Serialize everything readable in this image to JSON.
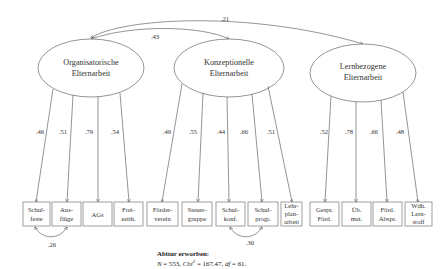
{
  "diagram": {
    "type": "structural-equation-model",
    "latent_factors": [
      {
        "id": "org",
        "label_line1": "Organisatorische",
        "label_line2": "Elternarbeit"
      },
      {
        "id": "konz",
        "label_line1": "Konzeptionelle",
        "label_line2": "Elternarbeit"
      },
      {
        "id": "lern",
        "label_line1": "Lernbezogene",
        "label_line2": "Elternarbeit"
      }
    ],
    "factor_correlations": [
      {
        "from": "org",
        "to": "konz",
        "value": ".43"
      },
      {
        "from": "org",
        "to": "lern",
        "value": ".21"
      }
    ],
    "indicators": [
      {
        "factor": "org",
        "line1": "Schul-",
        "line2": "feste",
        "line3": "",
        "loading": ".46"
      },
      {
        "factor": "org",
        "line1": "Aus-",
        "line2": "flüge",
        "line3": "",
        "loading": ".51"
      },
      {
        "factor": "org",
        "line1": "AGs",
        "line2": "",
        "line3": "",
        "loading": ".79"
      },
      {
        "factor": "org",
        "line1": "Frei-",
        "line2": "zeith.",
        "line3": "",
        "loading": ".54"
      },
      {
        "factor": "konz",
        "line1": "Förder-",
        "line2": "verein",
        "line3": "",
        "loading": ".49"
      },
      {
        "factor": "konz",
        "line1": "Steuer-",
        "line2": "gruppe",
        "line3": "",
        "loading": ".55"
      },
      {
        "factor": "konz",
        "line1": "Schul-",
        "line2": "konf.",
        "line3": "",
        "loading": ".44"
      },
      {
        "factor": "konz",
        "line1": "Schul-",
        "line2": "progr.",
        "line3": "",
        "loading": ".66"
      },
      {
        "factor": "konz",
        "line1": "Lehr-",
        "line2": "plan-",
        "line3": "arbeit",
        "loading": ".51"
      },
      {
        "factor": "lern",
        "line1": "Gespr.",
        "line2": "Förd.",
        "line3": "",
        "loading": ".52"
      },
      {
        "factor": "lern",
        "line1": "Üb.",
        "line2": "mat.",
        "line3": "",
        "loading": ".78"
      },
      {
        "factor": "lern",
        "line1": "Förd.",
        "line2": "Abspr.",
        "line3": "",
        "loading": ".66"
      },
      {
        "factor": "lern",
        "line1": "Wdh.",
        "line2": "Lern-",
        "line3": "stoff",
        "loading": ".48"
      }
    ],
    "residual_correlations": [
      {
        "between": [
          "Schulfeste",
          "Ausflüge"
        ],
        "value": ".26"
      },
      {
        "between": [
          "Schulkonf.",
          "Schulprogr."
        ],
        "value": ".30"
      }
    ]
  },
  "caption": {
    "title": "Abitur erworben:",
    "n_label": "N",
    "n_value": " = 553, ",
    "chi_label": "Chi",
    "chi_sup": "2",
    "chi_value": " = 167.47, ",
    "df_label": "df",
    "df_value": " = 61."
  }
}
